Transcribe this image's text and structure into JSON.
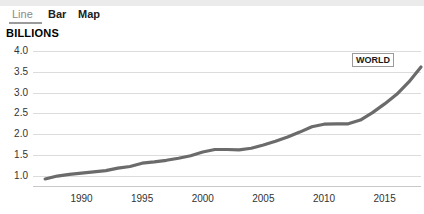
{
  "tabs": [
    {
      "label": "Line",
      "active": true,
      "name": "tab-line"
    },
    {
      "label": "Bar",
      "active": false,
      "name": "tab-bar"
    },
    {
      "label": "Map",
      "active": false,
      "name": "tab-map"
    }
  ],
  "units_label": "BILLIONS",
  "series_label": "WORLD",
  "colors": {
    "line": "#6b6b6b",
    "grid": "#dcdcdc",
    "axis": "#c8c8c8",
    "tab_active": "#8a8a8a",
    "tab_inactive": "#202020",
    "topband": "#ebebeb"
  },
  "chart_data": {
    "type": "line",
    "title": "",
    "subtitle": "",
    "xlabel": "",
    "ylabel": "BILLIONS",
    "xlim": [
      1986,
      2018
    ],
    "ylim": [
      0.75,
      4.15
    ],
    "grid": true,
    "legend": "inline-end-label",
    "ytick_labels": [
      "4.0",
      "3.5",
      "3.0",
      "2.5",
      "2.0",
      "1.5",
      "1.0"
    ],
    "ytick_values": [
      4.0,
      3.5,
      3.0,
      2.5,
      2.0,
      1.5,
      1.0
    ],
    "xtick_labels": [
      "1990",
      "1995",
      "2000",
      "2005",
      "2010",
      "2015"
    ],
    "xtick_values": [
      1990,
      1995,
      2000,
      2005,
      2010,
      2015
    ],
    "series": [
      {
        "name": "WORLD",
        "color": "#6b6b6b",
        "x": [
          1987,
          1988,
          1989,
          1990,
          1991,
          1992,
          1993,
          1994,
          1995,
          1996,
          1997,
          1998,
          1999,
          2000,
          2001,
          2002,
          2003,
          2004,
          2005,
          2006,
          2007,
          2008,
          2009,
          2010,
          2011,
          2012,
          2013,
          2014,
          2015,
          2016,
          2017,
          2018
        ],
        "values": [
          0.92,
          0.99,
          1.03,
          1.06,
          1.09,
          1.12,
          1.18,
          1.22,
          1.3,
          1.33,
          1.37,
          1.42,
          1.48,
          1.57,
          1.63,
          1.63,
          1.62,
          1.66,
          1.74,
          1.83,
          1.93,
          2.05,
          2.18,
          2.24,
          2.25,
          2.25,
          2.34,
          2.52,
          2.73,
          2.96,
          3.26,
          3.62
        ]
      }
    ]
  }
}
